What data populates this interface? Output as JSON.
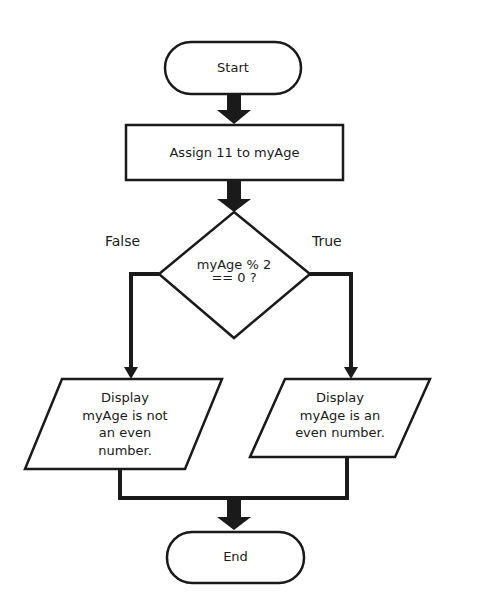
{
  "diagram": {
    "type": "flowchart",
    "nodes": {
      "start": {
        "shape": "terminator",
        "label": "Start"
      },
      "assign": {
        "shape": "process",
        "label": "Assign 11 to myAge"
      },
      "decision": {
        "shape": "decision",
        "line1": "myAge % 2",
        "line2": "== 0 ?"
      },
      "false_output": {
        "shape": "io",
        "lines": [
          "Display",
          "myAge is not",
          "an even",
          "number."
        ]
      },
      "true_output": {
        "shape": "io",
        "lines": [
          "Display",
          "myAge is an",
          "even number."
        ]
      },
      "end": {
        "shape": "terminator",
        "label": "End"
      }
    },
    "branch_labels": {
      "false": "False",
      "true": "True"
    },
    "edges": [
      {
        "from": "start",
        "to": "assign"
      },
      {
        "from": "assign",
        "to": "decision"
      },
      {
        "from": "decision",
        "to": "false_output",
        "label": "False"
      },
      {
        "from": "decision",
        "to": "true_output",
        "label": "True"
      },
      {
        "from": "false_output",
        "to": "end"
      },
      {
        "from": "true_output",
        "to": "end"
      }
    ]
  }
}
